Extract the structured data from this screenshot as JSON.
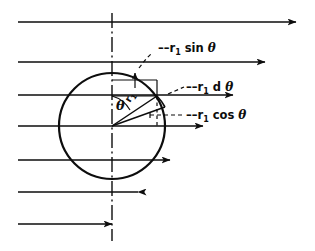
{
  "figure": {
    "colors": {
      "ink": "#0d0d0d",
      "background": "#ffffff"
    },
    "labels": {
      "sin_label": {
        "var": "r",
        "sub": "1",
        "fn": "sin",
        "theta": "θ",
        "full": "r₁ sin θ"
      },
      "d_theta_label": {
        "var": "r",
        "sub": "1",
        "fn": "d",
        "theta": "θ",
        "full": "r₁ d θ"
      },
      "cos_label": {
        "var": "r",
        "sub": "1",
        "fn": "cos",
        "theta": "θ",
        "full": "r₁ cos θ"
      },
      "angle_label": {
        "full": "θ"
      },
      "radius_label": {
        "var": "r",
        "sub": "1",
        "full": "r₁"
      }
    },
    "geometry": {
      "circle": {
        "cx": 112,
        "cy": 126,
        "r": 53
      },
      "axis": {
        "x": 112,
        "y_top": 13,
        "y_bottom": 241
      },
      "point_on_circle": {
        "x": 156,
        "y": 96
      },
      "theta_degrees": 33
    },
    "flow_lines": [
      {
        "name": "flow-line-1",
        "y": 22,
        "x_start": 18,
        "x_end": 296
      },
      {
        "name": "flow-line-2",
        "y": 62,
        "x_start": 18,
        "x_end": 265
      },
      {
        "name": "flow-line-3",
        "y": 95,
        "x_start": 18,
        "x_end": 233
      },
      {
        "name": "flow-line-4",
        "y": 126,
        "x_start": 18,
        "x_end": 203
      },
      {
        "name": "flow-line-5",
        "y": 160,
        "x_start": 18,
        "x_end": 170
      },
      {
        "name": "flow-line-6",
        "y": 192,
        "x_start": 18,
        "x_end": 138
      },
      {
        "name": "flow-line-7",
        "y": 224,
        "x_start": 18,
        "x_end": 112
      }
    ]
  }
}
